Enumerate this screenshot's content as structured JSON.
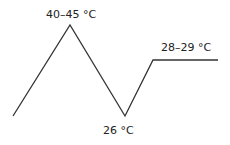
{
  "diagram": {
    "type": "temperature-profile",
    "line_color": "#333333",
    "points": [
      {
        "x": 13,
        "y": 116
      },
      {
        "x": 70,
        "y": 25
      },
      {
        "x": 125,
        "y": 116
      },
      {
        "x": 153,
        "y": 60
      },
      {
        "x": 218,
        "y": 60
      }
    ],
    "labels": [
      {
        "text": "40–45 °C",
        "x": 46,
        "y": 9
      },
      {
        "text": "26 °C",
        "x": 103,
        "y": 125
      },
      {
        "text": "28–29 °C",
        "x": 161,
        "y": 42
      }
    ]
  }
}
